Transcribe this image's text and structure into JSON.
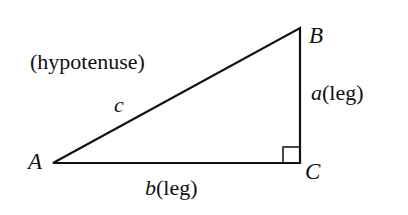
{
  "diagram": {
    "type": "right-triangle",
    "vertices": {
      "A": "A",
      "B": "B",
      "C": "C"
    },
    "sides": {
      "hypotenuse": {
        "var": "c",
        "note": "(hypotenuse)"
      },
      "vertical_leg": {
        "var": "a",
        "note": "(leg)"
      },
      "horizontal_leg": {
        "var": "b",
        "note": "(leg)"
      }
    },
    "right_angle_at": "C",
    "line_color": "#111111"
  }
}
